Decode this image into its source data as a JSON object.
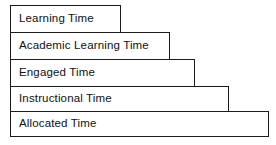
{
  "diagram": {
    "type": "nested-staircase-hierarchy",
    "orientation": "widening-downward",
    "canvas": {
      "width": 276,
      "height": 145,
      "background": "#ffffff"
    },
    "style": {
      "stroke_color": "#1a1a1a",
      "stroke_width_px": 1.6,
      "fill_color": "#ffffff",
      "text_color": "#111111"
    },
    "tiers": [
      {
        "label": "Learning Time",
        "level": 1,
        "left": 10,
        "top": 5,
        "width": 111,
        "height": 28
      },
      {
        "label": "Academic Learning Time",
        "level": 2,
        "left": 10,
        "top": 32,
        "width": 160,
        "height": 28
      },
      {
        "label": "Engaged Time",
        "level": 3,
        "left": 10,
        "top": 59,
        "width": 185,
        "height": 28
      },
      {
        "label": "Instructional Time",
        "level": 4,
        "left": 10,
        "top": 86,
        "width": 219,
        "height": 26
      },
      {
        "label": "Allocated Time",
        "level": 5,
        "left": 10,
        "top": 111,
        "width": 259,
        "height": 26
      }
    ]
  }
}
